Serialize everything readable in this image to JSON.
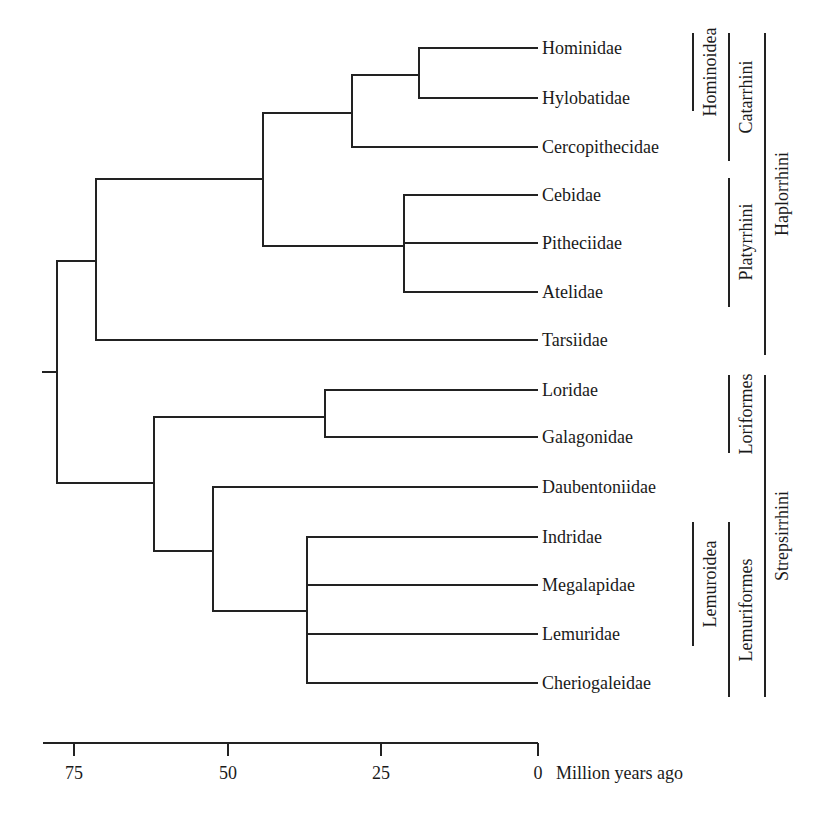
{
  "diagram": {
    "type": "phylogenetic-tree",
    "orientation": "left-to-right",
    "leaves": [
      {
        "id": "hominidae",
        "label": "Hominidae"
      },
      {
        "id": "hylobatidae",
        "label": "Hylobatidae"
      },
      {
        "id": "cercopithecidae",
        "label": "Cercopithecidae"
      },
      {
        "id": "cebidae",
        "label": "Cebidae"
      },
      {
        "id": "pitheciidae",
        "label": "Pitheciidae"
      },
      {
        "id": "atelidae",
        "label": "Atelidae"
      },
      {
        "id": "tarsiidae",
        "label": "Tarsiidae"
      },
      {
        "id": "loridae",
        "label": "Loridae"
      },
      {
        "id": "galagonidae",
        "label": "Galagonidae"
      },
      {
        "id": "daubentoniidae",
        "label": "Daubentoniidae"
      },
      {
        "id": "indridae",
        "label": "Indridae"
      },
      {
        "id": "megalapidae",
        "label": "Megalapidae"
      },
      {
        "id": "lemuridae",
        "label": "Lemuridae"
      },
      {
        "id": "cheriogaleidae",
        "label": "Cheriogaleidae"
      }
    ],
    "nodes": [
      {
        "id": "hominoidea",
        "children": [
          "hominidae",
          "hylobatidae"
        ],
        "age_mya": 19
      },
      {
        "id": "catarrhini",
        "children": [
          "hominoidea",
          "cercopithecidae"
        ],
        "age_mya": 30
      },
      {
        "id": "platyrrhini",
        "children": [
          "cebidae",
          "pitheciidae",
          "atelidae"
        ],
        "age_mya": 22
      },
      {
        "id": "anthropoidea",
        "children": [
          "catarrhini",
          "platyrrhini"
        ],
        "age_mya": 45
      },
      {
        "id": "haplorrhini",
        "children": [
          "anthropoidea",
          "tarsiidae"
        ],
        "age_mya": 72
      },
      {
        "id": "loriformes",
        "children": [
          "loridae",
          "galagonidae"
        ],
        "age_mya": 35
      },
      {
        "id": "lemuroidea",
        "children": [
          "indridae",
          "megalapidae",
          "lemuridae",
          "cheriogaleidae"
        ],
        "age_mya": 38
      },
      {
        "id": "lemuriformes",
        "children": [
          "daubentoniidae",
          "lemuroidea"
        ],
        "age_mya": 53
      },
      {
        "id": "strepsirrhini",
        "children": [
          "loriformes",
          "lemuriformes"
        ],
        "age_mya": 63
      },
      {
        "id": "primates",
        "children": [
          "haplorrhini",
          "strepsirrhini"
        ],
        "age_mya": 78
      }
    ],
    "clade_brackets": [
      {
        "id": "hominoidea",
        "label": "Hominoidea",
        "column": 1,
        "spans": [
          "Hominidae",
          "Hylobatidae"
        ]
      },
      {
        "id": "catarrhini",
        "label": "Catarrhini",
        "column": 2,
        "spans": [
          "Hominidae",
          "Hylobatidae",
          "Cercopithecidae"
        ]
      },
      {
        "id": "haplorrhini",
        "label": "Haplorrhini",
        "column": 3,
        "spans": [
          "Hominidae",
          "Hylobatidae",
          "Cercopithecidae",
          "Cebidae",
          "Pitheciidae",
          "Atelidae",
          "Tarsiidae"
        ]
      },
      {
        "id": "platyrrhini",
        "label": "Platyrrhini",
        "column": 2,
        "spans": [
          "Cebidae",
          "Pitheciidae",
          "Atelidae"
        ]
      },
      {
        "id": "loriformes",
        "label": "Loriformes",
        "column": 2,
        "spans": [
          "Loridae",
          "Galagonidae"
        ]
      },
      {
        "id": "strepsirrhini",
        "label": "Strepsirrhini",
        "column": 3,
        "spans": [
          "Loridae",
          "Galagonidae",
          "Daubentoniidae",
          "Indridae",
          "Megalapidae",
          "Lemuridae",
          "Cheriogaleidae"
        ]
      },
      {
        "id": "lemuroidea",
        "label": "Lemuroidea",
        "column": 1,
        "spans": [
          "Indridae",
          "Megalapidae",
          "Lemuridae",
          "Cheriogaleidae"
        ]
      },
      {
        "id": "lemuriformes",
        "label": "Lemuriformes",
        "column": 2,
        "spans": [
          "Indridae",
          "Megalapidae",
          "Lemuridae",
          "Cheriogaleidae"
        ]
      }
    ],
    "axis": {
      "title": "Million years ago",
      "ticks": [
        {
          "value": 75,
          "label": "75"
        },
        {
          "value": 50,
          "label": "50"
        },
        {
          "value": 25,
          "label": "25"
        },
        {
          "value": 0,
          "label": "0"
        }
      ],
      "range": [
        80,
        0
      ]
    }
  }
}
